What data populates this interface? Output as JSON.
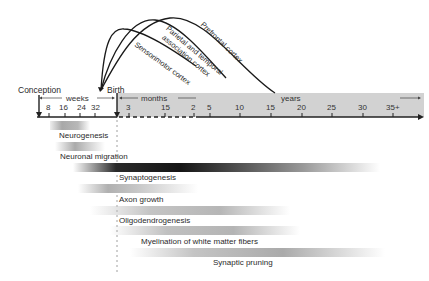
{
  "diagram": {
    "timeline": {
      "start_label": "Conception",
      "birth_label": "Birth",
      "segments": [
        {
          "unit": "weeks",
          "ticks": [
            "8",
            "16",
            "24",
            "32"
          ]
        },
        {
          "unit": "months",
          "ticks": [
            "3",
            "15"
          ]
        },
        {
          "unit": "years",
          "ticks": [
            "2",
            "5",
            "10",
            "15",
            "20",
            "25",
            "30",
            "35+"
          ]
        }
      ]
    },
    "cortex_curves": [
      {
        "label": "Sensorimotor cortex"
      },
      {
        "label": "Parietal and temporal association cortex",
        "line1": "Parietal and temporal",
        "line2": "association cortex"
      },
      {
        "label": "Prefrontal cortex"
      }
    ],
    "processes": [
      {
        "label": "Neurogenesis"
      },
      {
        "label": "Neuronal migration"
      },
      {
        "label": "Synaptogenesis"
      },
      {
        "label": "Axon growth"
      },
      {
        "label": "Oligodendrogenesis"
      },
      {
        "label": "Myelination of white matter fibers"
      },
      {
        "label": "Synaptic pruning"
      }
    ],
    "colors": {
      "axis_band": "#d0d0d0",
      "line": "#1a1a1a",
      "bar_dark": "#1e1e1e",
      "bar_mid": "#9a9a9a",
      "bar_light": "#c8c8c8"
    }
  }
}
